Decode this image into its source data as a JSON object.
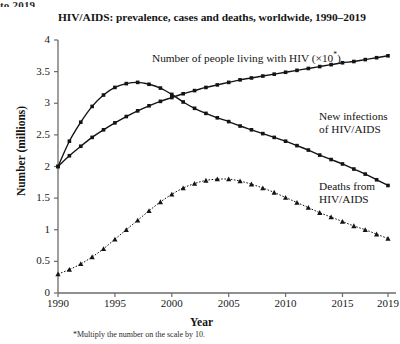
{
  "top_clipped_text": "to 2019.",
  "axes": {
    "y_title": "Number (millions)",
    "x_title": "Year",
    "y_ticks": [
      "0",
      "0.5",
      "1",
      "1.5",
      "2",
      "2.5",
      "3",
      "3.5",
      "4"
    ],
    "x_ticks": [
      "1990",
      "1995",
      "2000",
      "2005",
      "2010",
      "2015",
      "2019"
    ]
  },
  "labels": {
    "prevalence_main": "Number of people living with HIV (×10",
    "prevalence_sup": "*",
    "prevalence_close": ")",
    "infections_line1": "New infections",
    "infections_line2": "of HIV/AIDS",
    "deaths_line1": "Deaths from",
    "deaths_line2": "HIV/AIDS"
  },
  "footnote": "*Multiply the number on the scale by 10.",
  "colors": {
    "ink": "#141414",
    "axis": "#6b6b6b",
    "background": "#ffffff"
  },
  "chart_data": {
    "type": "line",
    "title": "HIV/AIDS: prevalence, cases and deaths, worldwide, 1990–2019",
    "xlabel": "Year",
    "ylabel": "Number (millions)",
    "xlim": [
      1990,
      2019
    ],
    "ylim": [
      0,
      4
    ],
    "ytick_step": 0.5,
    "grid": false,
    "legend": "inline-annotations",
    "note": "*Multiply the number on the scale by 10.",
    "x": [
      1990,
      1991,
      1992,
      1993,
      1994,
      1995,
      1996,
      1997,
      1998,
      1999,
      2000,
      2001,
      2002,
      2003,
      2004,
      2005,
      2006,
      2007,
      2008,
      2009,
      2010,
      2011,
      2012,
      2013,
      2014,
      2015,
      2016,
      2017,
      2018,
      2019
    ],
    "series": [
      {
        "name": "Number of people living with HIV (×10*)",
        "marker": "square",
        "linestyle": "solid",
        "values": [
          2.0,
          2.17,
          2.32,
          2.46,
          2.58,
          2.69,
          2.79,
          2.88,
          2.96,
          3.03,
          3.09,
          3.15,
          3.2,
          3.25,
          3.29,
          3.33,
          3.37,
          3.4,
          3.43,
          3.46,
          3.49,
          3.52,
          3.55,
          3.58,
          3.61,
          3.64,
          3.66,
          3.69,
          3.72,
          3.75
        ]
      },
      {
        "name": "New infections of HIV/AIDS",
        "marker": "square",
        "linestyle": "solid",
        "values": [
          2.0,
          2.4,
          2.7,
          2.95,
          3.13,
          3.25,
          3.31,
          3.33,
          3.3,
          3.24,
          3.14,
          3.02,
          2.92,
          2.84,
          2.77,
          2.71,
          2.64,
          2.58,
          2.52,
          2.46,
          2.4,
          2.33,
          2.26,
          2.18,
          2.11,
          2.04,
          1.96,
          1.88,
          1.79,
          1.7
        ]
      },
      {
        "name": "Deaths from HIV/AIDS",
        "marker": "triangle",
        "linestyle": "dotted",
        "values": [
          0.3,
          0.37,
          0.46,
          0.57,
          0.7,
          0.85,
          1.0,
          1.15,
          1.3,
          1.44,
          1.56,
          1.66,
          1.73,
          1.78,
          1.8,
          1.8,
          1.77,
          1.72,
          1.66,
          1.59,
          1.51,
          1.43,
          1.35,
          1.27,
          1.2,
          1.13,
          1.06,
          1.0,
          0.93,
          0.86
        ]
      }
    ]
  }
}
